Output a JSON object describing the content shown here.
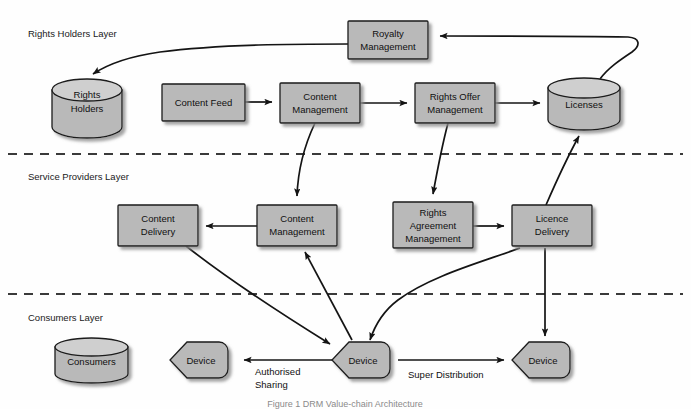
{
  "figure": {
    "caption": "Figure 1  DRM Value-chain Architecture",
    "background": "#ffffff",
    "shape_fill": "#b9b9b9",
    "shape_stroke": "#1c1c1c",
    "line_color": "#141414"
  },
  "layers": [
    {
      "id": "rights-holders",
      "label": "Rights Holders Layer",
      "x": 28,
      "y": 33
    },
    {
      "id": "service-providers",
      "label": "Service Providers Layer",
      "x": 28,
      "y": 176
    },
    {
      "id": "consumers",
      "label": "Consumers Layer",
      "x": 28,
      "y": 317
    }
  ],
  "dividers": [
    {
      "id": "divider-rights-service",
      "y": 154
    },
    {
      "id": "divider-service-consumers",
      "y": 294
    }
  ],
  "nodes": [
    {
      "id": "rights-holders-store",
      "type": "cylinder",
      "label": "Rights\nHolders",
      "x": 52,
      "y": 80,
      "w": 70,
      "h": 57
    },
    {
      "id": "content-feed",
      "type": "box",
      "label": "Content Feed",
      "x": 162,
      "y": 84,
      "w": 83,
      "h": 37
    },
    {
      "id": "content-management-rh",
      "type": "box",
      "label": "Content\nManagement",
      "x": 280,
      "y": 83,
      "w": 80,
      "h": 40
    },
    {
      "id": "rights-offer-management",
      "type": "box",
      "label": "Rights Offer\nManagement",
      "x": 415,
      "y": 83,
      "w": 80,
      "h": 40
    },
    {
      "id": "royalty-management",
      "type": "box",
      "label": "Royalty\nManagement",
      "x": 348,
      "y": 21,
      "w": 80,
      "h": 38
    },
    {
      "id": "licenses-store",
      "type": "cylinder",
      "label": "Licenses",
      "x": 548,
      "y": 78,
      "w": 72,
      "h": 52
    },
    {
      "id": "content-delivery",
      "type": "box",
      "label": "Content\nDelivery",
      "x": 118,
      "y": 205,
      "w": 80,
      "h": 41
    },
    {
      "id": "content-management-sp",
      "type": "box",
      "label": "Content\nManagement",
      "x": 257,
      "y": 205,
      "w": 80,
      "h": 41
    },
    {
      "id": "rights-agreement-management",
      "type": "box",
      "label": "Rights\nAgreement\nManagement",
      "x": 393,
      "y": 202,
      "w": 80,
      "h": 46
    },
    {
      "id": "licence-delivery",
      "type": "box",
      "label": "Licence\nDelivery",
      "x": 512,
      "y": 205,
      "w": 80,
      "h": 41
    },
    {
      "id": "consumers-store",
      "type": "cylinder",
      "label": "Consumers",
      "x": 55,
      "y": 338,
      "w": 73,
      "h": 45
    },
    {
      "id": "device-left",
      "type": "hexagon",
      "label": "Device",
      "x": 170,
      "y": 342,
      "w": 66,
      "h": 36
    },
    {
      "id": "device-center",
      "type": "hexagon",
      "label": "Device",
      "x": 332,
      "y": 342,
      "w": 66,
      "h": 36
    },
    {
      "id": "device-right",
      "type": "hexagon",
      "label": "Device",
      "x": 512,
      "y": 342,
      "w": 66,
      "h": 36
    }
  ],
  "edges": [
    {
      "id": "royalty-to-rights-holders",
      "from": "royalty-management",
      "to": "rights-holders-store",
      "label": ""
    },
    {
      "id": "content-feed-to-content-management",
      "from": "content-feed",
      "to": "content-management-rh",
      "label": ""
    },
    {
      "id": "content-management-to-rights-offer",
      "from": "content-management-rh",
      "to": "rights-offer-management",
      "label": ""
    },
    {
      "id": "rights-offer-to-licenses",
      "from": "rights-offer-management",
      "to": "licenses-store",
      "label": ""
    },
    {
      "id": "licenses-to-royalty",
      "from": "licenses-store",
      "to": "royalty-management",
      "label": ""
    },
    {
      "id": "content-management-rh-to-sp",
      "from": "content-management-rh",
      "to": "content-management-sp",
      "label": ""
    },
    {
      "id": "rights-offer-to-rights-agreement",
      "from": "rights-offer-management",
      "to": "rights-agreement-management",
      "label": ""
    },
    {
      "id": "content-management-sp-to-content-delivery",
      "from": "content-management-sp",
      "to": "content-delivery",
      "label": ""
    },
    {
      "id": "content-management-sp-to-rights-agreement",
      "from": "content-management-sp",
      "to": "rights-agreement-management",
      "label": ""
    },
    {
      "id": "rights-agreement-to-licence-delivery",
      "from": "rights-agreement-management",
      "to": "licence-delivery",
      "label": ""
    },
    {
      "id": "licence-delivery-to-licenses",
      "from": "licence-delivery",
      "to": "licenses-store",
      "label": ""
    },
    {
      "id": "content-delivery-to-device-center",
      "from": "content-delivery",
      "to": "device-center",
      "label": ""
    },
    {
      "id": "device-center-to-content-management-sp",
      "from": "device-center",
      "to": "content-management-sp",
      "label": ""
    },
    {
      "id": "licence-delivery-to-device-center",
      "from": "licence-delivery",
      "to": "device-center",
      "label": ""
    },
    {
      "id": "licence-delivery-to-device-right",
      "from": "licence-delivery",
      "to": "device-right",
      "label": ""
    },
    {
      "id": "device-center-to-device-left",
      "from": "device-center",
      "to": "device-left",
      "label": "Authorised Sharing"
    },
    {
      "id": "device-center-to-device-right",
      "from": "device-center",
      "to": "device-right",
      "label": "Super Distribution"
    }
  ],
  "edge_labels": {
    "authorised_sharing_line1": "Authorised",
    "authorised_sharing_line2": "Sharing",
    "super_distribution": "Super Distribution"
  },
  "node_text": {
    "rights_holders_l1": "Rights",
    "rights_holders_l2": "Holders",
    "content_feed": "Content Feed",
    "content_management_l1": "Content",
    "content_management_l2": "Management",
    "rights_offer_l1": "Rights Offer",
    "rights_offer_l2": "Management",
    "royalty_l1": "Royalty",
    "royalty_l2": "Management",
    "licenses": "Licenses",
    "content_delivery_l1": "Content",
    "content_delivery_l2": "Delivery",
    "rights_agreement_l1": "Rights",
    "rights_agreement_l2": "Agreement",
    "rights_agreement_l3": "Management",
    "licence_delivery_l1": "Licence",
    "licence_delivery_l2": "Delivery",
    "consumers": "Consumers",
    "device": "Device"
  }
}
